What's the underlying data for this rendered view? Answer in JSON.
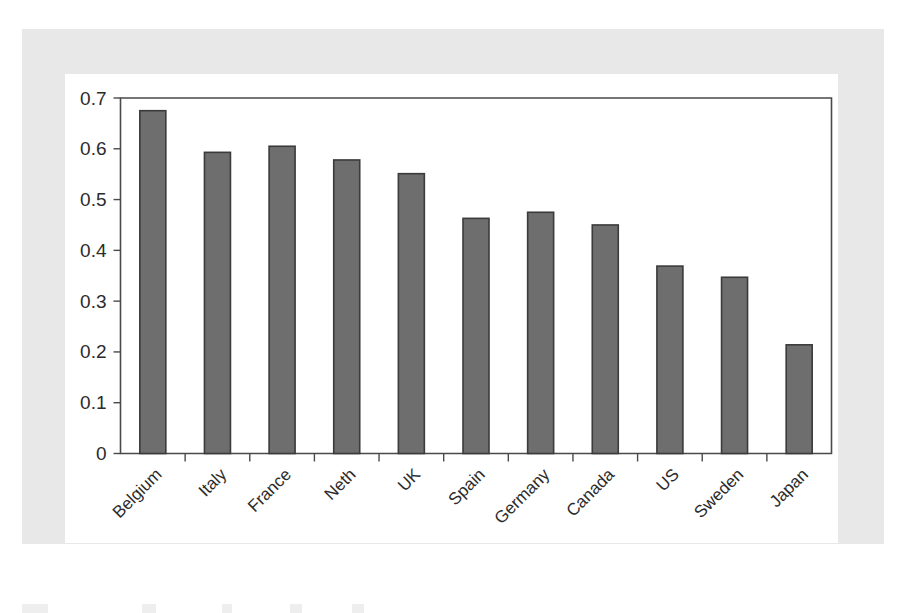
{
  "chart_data": {
    "type": "bar",
    "title": "",
    "subtitle": "",
    "xlabel": "",
    "ylabel": "",
    "categories": [
      "Belgium",
      "Italy",
      "France",
      "Neth",
      "UK",
      "Spain",
      "Germany",
      "Canada",
      "US",
      "Sweden",
      "Japan"
    ],
    "values": [
      0.675,
      0.593,
      0.605,
      0.578,
      0.551,
      0.463,
      0.475,
      0.45,
      0.369,
      0.347,
      0.214
    ],
    "ylim": [
      0,
      0.7
    ],
    "ytick_labels": [
      "0",
      "0.1",
      "0.2",
      "0.3",
      "0.4",
      "0.5",
      "0.6",
      "0.7"
    ],
    "ytick_values": [
      0,
      0.1,
      0.2,
      0.3,
      0.4,
      0.5,
      0.6,
      0.7
    ],
    "grid": false,
    "legend": null,
    "legend_position": "none",
    "annotations": [],
    "bar_color": "#6e6e6e",
    "bar_edge_color": "#3b3b3b",
    "axis_color": "#4a4a4a",
    "xlabel_rotation_deg": -45,
    "series": [
      {
        "name": "value",
        "values": [
          0.675,
          0.593,
          0.605,
          0.578,
          0.551,
          0.463,
          0.475,
          0.45,
          0.369,
          0.347,
          0.214
        ]
      }
    ]
  },
  "figure": {
    "background_color": "#ffffff",
    "frame_color": "#e8e8e8",
    "panel_color": "#ffffff"
  }
}
